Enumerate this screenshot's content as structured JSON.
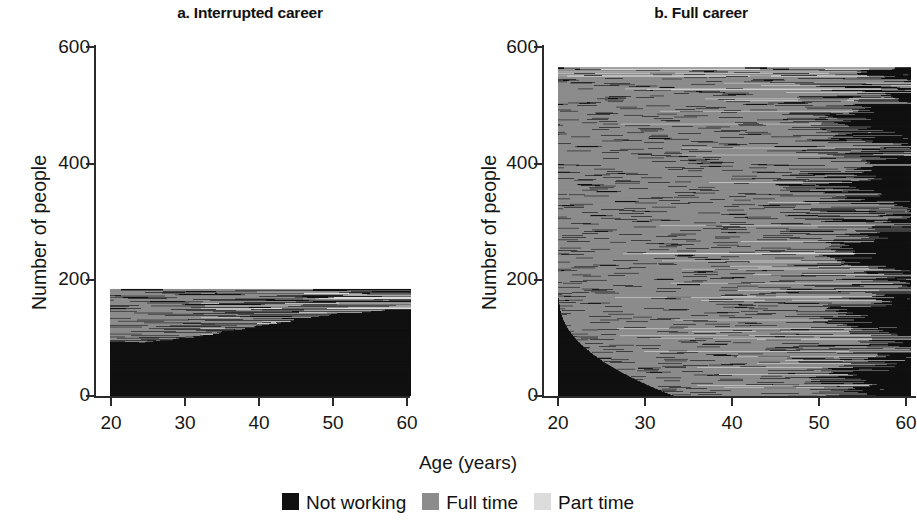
{
  "figure": {
    "x_axis_title": "Age (years)",
    "y_axis_title": "Number of people"
  },
  "panels": [
    {
      "title": "a. Interrupted career"
    },
    {
      "title": "b. Full career"
    }
  ],
  "legend": {
    "items": [
      {
        "label": "Not working",
        "color": "#111111",
        "key": "not_working"
      },
      {
        "label": "Full time",
        "color": "#8c8c8c",
        "key": "full_time"
      },
      {
        "label": "Part time",
        "color": "#dcdcdc",
        "key": "part_time"
      }
    ]
  },
  "chart_data": {
    "type": "heatmap",
    "subtype": "sequence-index-plot",
    "title": "",
    "xlabel": "Age (years)",
    "ylabel": "Number of people",
    "xlim": [
      20,
      61
    ],
    "ylim": [
      0,
      600
    ],
    "xticks": [
      20,
      30,
      40,
      50,
      60
    ],
    "yticks": [
      0,
      200,
      400,
      600
    ],
    "grid": false,
    "legend_position": "bottom-center",
    "states": [
      {
        "key": "not_working",
        "label": "Not working",
        "color": "#111111"
      },
      {
        "key": "full_time",
        "label": "Full time",
        "color": "#8c8c8c"
      },
      {
        "key": "part_time",
        "label": "Part time",
        "color": "#dcdcdc"
      }
    ],
    "panels": [
      {
        "id": "a",
        "title": "a. Interrupted career",
        "n_people": 183,
        "stack_top_value": 183,
        "description": "Interrupted careers: large black (not working) mass from the bottom growing with age, gray full-time band at top shrinking, thin part-time stripes in the middle.",
        "band_fractions_by_age": {
          "20": {
            "not_working": 0.68,
            "full_time": 0.31,
            "part_time": 0.01
          },
          "25": {
            "not_working": 0.7,
            "full_time": 0.28,
            "part_time": 0.02
          },
          "30": {
            "not_working": 0.73,
            "full_time": 0.22,
            "part_time": 0.05
          },
          "35": {
            "not_working": 0.74,
            "full_time": 0.17,
            "part_time": 0.09
          },
          "40": {
            "not_working": 0.75,
            "full_time": 0.14,
            "part_time": 0.11
          },
          "45": {
            "not_working": 0.76,
            "full_time": 0.12,
            "part_time": 0.12
          },
          "50": {
            "not_working": 0.79,
            "full_time": 0.11,
            "part_time": 0.1
          },
          "55": {
            "not_working": 0.85,
            "full_time": 0.08,
            "part_time": 0.07
          },
          "60": {
            "not_working": 0.93,
            "full_time": 0.04,
            "part_time": 0.03
          }
        }
      },
      {
        "id": "b",
        "title": "b. Full career",
        "n_people": 562,
        "stack_top_value": 562,
        "description": "Full careers: dominated by gray full-time from age 20 to the mid 50s; a black not-working wedge at the very bottom-left (late entry) and a growing black region at the right (retirement after 50); thin light part-time stripes scattered throughout.",
        "band_fractions_by_age": {
          "20": {
            "not_working": 0.3,
            "full_time": 0.69,
            "part_time": 0.01
          },
          "25": {
            "not_working": 0.1,
            "full_time": 0.88,
            "part_time": 0.02
          },
          "30": {
            "not_working": 0.05,
            "full_time": 0.92,
            "part_time": 0.03
          },
          "35": {
            "not_working": 0.04,
            "full_time": 0.92,
            "part_time": 0.04
          },
          "40": {
            "not_working": 0.05,
            "full_time": 0.91,
            "part_time": 0.04
          },
          "45": {
            "not_working": 0.08,
            "full_time": 0.87,
            "part_time": 0.05
          },
          "50": {
            "not_working": 0.2,
            "full_time": 0.74,
            "part_time": 0.06
          },
          "55": {
            "not_working": 0.52,
            "full_time": 0.42,
            "part_time": 0.06
          },
          "60": {
            "not_working": 0.86,
            "full_time": 0.11,
            "part_time": 0.03
          }
        }
      }
    ]
  }
}
